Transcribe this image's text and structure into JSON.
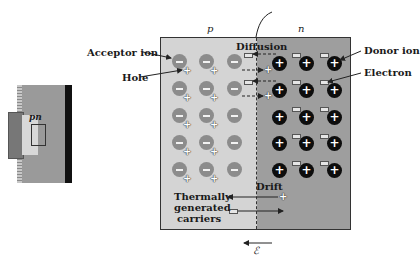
{
  "inset": {
    "label": "pn",
    "description": "device cross-section showing p-n junction"
  },
  "diagram": {
    "region_labels": {
      "p": "p",
      "n": "n"
    },
    "junction_label": "Junction",
    "labels": {
      "acceptor_ion": "Acceptor ion",
      "hole": "Hole",
      "donor_ion": "Donor ion",
      "electron": "Electron",
      "diffusion": "Diffusion",
      "drift": "Drift",
      "thermal_line1": "Thermally",
      "thermal_line2": "generated",
      "thermal_line3": "carriers",
      "field_symbol": "ℰ"
    },
    "colors": {
      "p_region": "#d4d4d4",
      "n_region": "#9e9e9e",
      "acceptor_ion": "#8c8c8c",
      "donor_ion": "#0d0d0d"
    },
    "grid": {
      "rows": 5,
      "p_columns": 3,
      "n_columns": 3
    }
  }
}
